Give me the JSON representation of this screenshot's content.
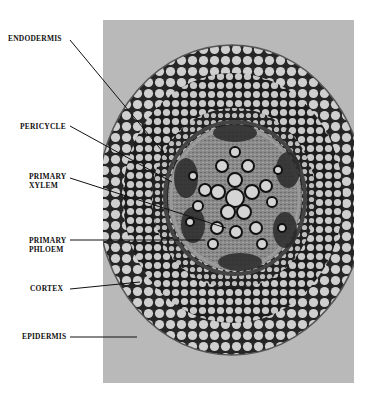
{
  "figure": {
    "labels": [
      {
        "id": "endodermis",
        "lines": [
          "ENDODERMIS"
        ]
      },
      {
        "id": "pericycle",
        "lines": [
          "PERICYCLE"
        ]
      },
      {
        "id": "primary-xylem",
        "lines": [
          "PRIMARY",
          "XYLEM"
        ]
      },
      {
        "id": "primary-phloem",
        "lines": [
          "PRIMARY",
          "PHLOEM"
        ]
      },
      {
        "id": "cortex",
        "lines": [
          "CORTEX"
        ]
      },
      {
        "id": "epidermis",
        "lines": [
          "EPIDERMIS"
        ]
      }
    ],
    "colors": {
      "background": "#ffffff",
      "photo_background": "#b9b9b9",
      "cell_wall": "#1a1a1a",
      "cell_lumen": "#c8c8c8",
      "leader_line": "#111111"
    }
  }
}
